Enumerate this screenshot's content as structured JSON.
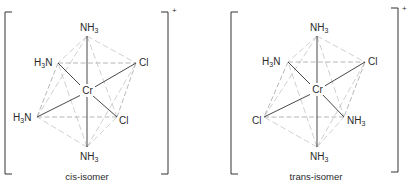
{
  "figure": {
    "panels": [
      {
        "id": "cis",
        "caption": "cis-isomer",
        "charge": "+",
        "center": {
          "label": "Cr"
        },
        "ligands": {
          "top": {
            "main": "NH",
            "sub": "3",
            "order": "main-sub"
          },
          "upper_left": {
            "main": "N",
            "pre": "H",
            "sub": "3",
            "order": "pre-sub-main"
          },
          "upper_right": {
            "main": "Cl"
          },
          "lower_left": {
            "main": "N",
            "pre": "H",
            "sub": "3",
            "order": "pre-sub-main"
          },
          "lower_right": {
            "main": "Cl"
          },
          "bottom": {
            "main": "NH",
            "sub": "3",
            "order": "main-sub"
          }
        }
      },
      {
        "id": "trans",
        "caption": "trans-isomer",
        "charge": "+",
        "center": {
          "label": "Cr"
        },
        "ligands": {
          "top": {
            "main": "NH",
            "sub": "3",
            "order": "main-sub"
          },
          "upper_left": {
            "main": "N",
            "pre": "H",
            "sub": "3",
            "order": "pre-sub-main"
          },
          "upper_right": {
            "main": "Cl"
          },
          "lower_left": {
            "main": "Cl"
          },
          "lower_right": {
            "main": "NH",
            "sub": "3",
            "order": "main-sub"
          },
          "bottom": {
            "main": "NH",
            "sub": "3",
            "order": "main-sub"
          }
        }
      }
    ]
  }
}
